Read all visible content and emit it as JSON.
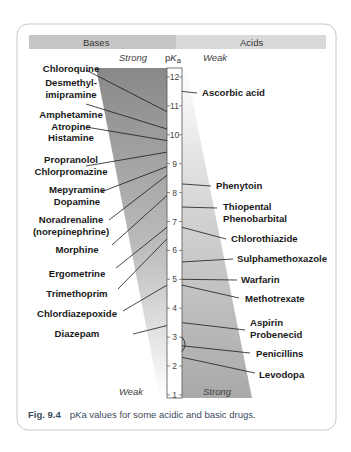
{
  "header": {
    "bases_label": "Bases",
    "acids_label": "Acids"
  },
  "axis": {
    "label_p": "p",
    "label_K": "K",
    "label_a": "a",
    "left_top": "Strong",
    "right_top": "Weak",
    "left_bottom": "Weak",
    "right_bottom": "Strong",
    "ticks": [
      "12",
      "11",
      "10",
      "9",
      "8",
      "7",
      "6",
      "5",
      "4",
      "3",
      "2",
      "1"
    ]
  },
  "bases": [
    {
      "lines": [
        "Chloroquine"
      ],
      "pka": 10.8
    },
    {
      "lines": [
        "Desmethyl-",
        "imipramine"
      ],
      "pka": 10.2
    },
    {
      "lines": [
        "Amphetamine",
        "Atropine",
        "Histamine"
      ],
      "pka": 9.8
    },
    {
      "lines": [
        "Propranolol",
        "Chlorpromazine"
      ],
      "pka": 9.4
    },
    {
      "lines": [
        "Mepyramine",
        "Dopamine"
      ],
      "pka": 8.9
    },
    {
      "lines": [
        "Noradrenaline",
        "(norepinephrine)"
      ],
      "pka": 8.6
    },
    {
      "lines": [
        "Morphine"
      ],
      "pka": 7.9
    },
    {
      "lines": [
        "Ergometrine"
      ],
      "pka": 6.8
    },
    {
      "lines": [
        "Trimethoprim"
      ],
      "pka": 6.4
    },
    {
      "lines": [
        "Chlordiazepoxide"
      ],
      "pka": 4.8
    },
    {
      "lines": [
        "Diazepam"
      ],
      "pka": 3.4
    }
  ],
  "acids": [
    {
      "lines": [
        "Ascorbic acid"
      ],
      "pka": 11.5
    },
    {
      "lines": [
        "Phenytoin"
      ],
      "pka": 8.3
    },
    {
      "lines": [
        "Thiopental",
        "Phenobarbital"
      ],
      "pka": 7.5
    },
    {
      "lines": [
        "Chlorothiazide"
      ],
      "pka": 6.8
    },
    {
      "lines": [
        "Sulphamethoxazole"
      ],
      "pka": 5.6
    },
    {
      "lines": [
        "Warfarin"
      ],
      "pka": 5.0
    },
    {
      "lines": [
        "Methotrexate"
      ],
      "pka": 4.8
    },
    {
      "lines": [
        "Aspirin",
        "Probenecid"
      ],
      "pka": 3.5
    },
    {
      "lines": [
        "Penicillins"
      ],
      "pka": 2.7,
      "range": [
        2.5,
        3.0
      ]
    },
    {
      "lines": [
        "Levodopa"
      ],
      "pka": 2.3
    }
  ],
  "caption": {
    "fig_label": "Fig. 9.4",
    "text_p": "p",
    "text_K": "K",
    "text_rest": "a values for some acidic and basic drugs."
  },
  "colors": {
    "bases_header": "#c6c6c6",
    "acids_header": "#d9d9d9",
    "wedge_dark": "#8a8a8a",
    "card_border": "#c8c8c8",
    "caption": "#3a4a5c"
  }
}
